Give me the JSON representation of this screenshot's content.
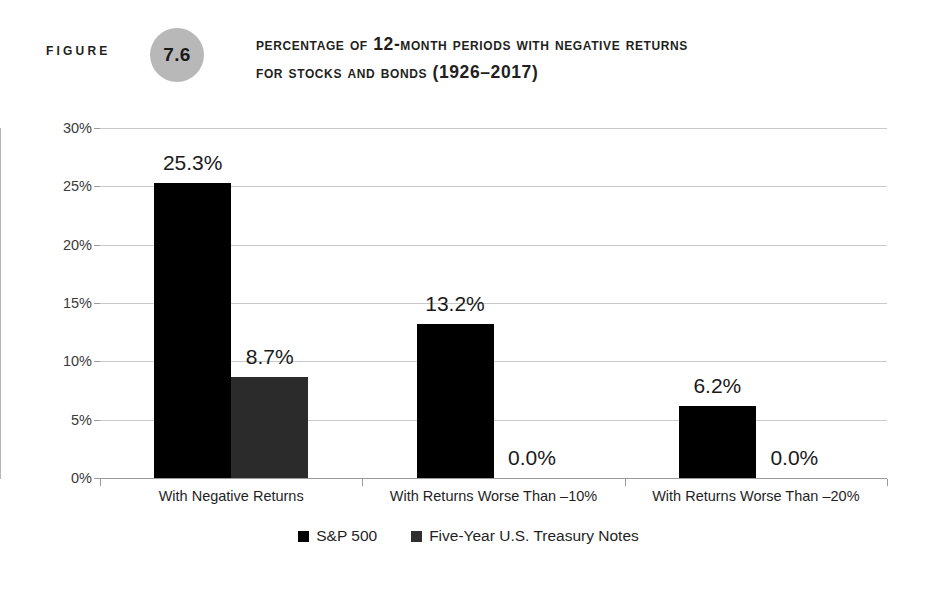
{
  "figure": {
    "label": "Figure",
    "number": "7.6",
    "title_line_1": "Percentage of 12-Month Periods with Negative Returns",
    "title_line_2": "for Stocks and Bonds (1926–2017)"
  },
  "colors": {
    "sp500": "#000000",
    "treasury": "#2b2b2b",
    "gridline": "#c9c9c9",
    "badge": "#b8b8b8",
    "text": "#1a1a1a"
  },
  "chart_data": {
    "type": "bar",
    "title": "Percentage of 12-Month Periods with Negative Returns for Stocks and Bonds (1926–2017)",
    "xlabel": "",
    "ylabel": "",
    "ylim": [
      0,
      30
    ],
    "ytick_values": [
      0,
      5,
      10,
      15,
      20,
      25,
      30
    ],
    "ytick_labels": [
      "0%",
      "5%",
      "10%",
      "15%",
      "20%",
      "25%",
      "30%"
    ],
    "grid": true,
    "legend_position": "bottom-center",
    "categories": [
      "With Negative Returns",
      "With Returns Worse Than –10%",
      "With Returns Worse Than –20%"
    ],
    "series": [
      {
        "name": "S&P 500",
        "color": "#000000",
        "values": [
          25.3,
          13.2,
          6.2
        ],
        "labels": [
          "25.3%",
          "13.2%",
          "6.2%"
        ]
      },
      {
        "name": "Five-Year U.S. Treasury Notes",
        "color": "#2b2b2b",
        "values": [
          8.7,
          0.0,
          0.0
        ],
        "labels": [
          "8.7%",
          "0.0%",
          "0.0%"
        ]
      }
    ]
  },
  "legend": {
    "items": [
      {
        "label": "S&P 500"
      },
      {
        "label": "Five-Year U.S. Treasury Notes"
      }
    ]
  }
}
